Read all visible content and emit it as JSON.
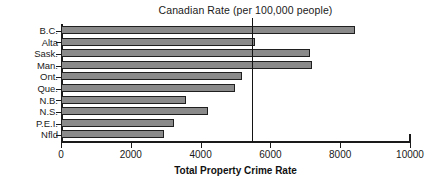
{
  "chart_data": {
    "type": "bar",
    "orientation": "horizontal",
    "title": "Canadian Rate (per 100,000 people)",
    "xlabel": "Total Property Crime Rate",
    "ylabel": "",
    "categories": [
      "B.C.",
      "Alta",
      "Sask.",
      "Man.",
      "Ont.",
      "Que.",
      "N.B.",
      "N.S.",
      "P.E.I.",
      "Nfld"
    ],
    "values": [
      8420,
      5570,
      7130,
      7200,
      5200,
      4980,
      3580,
      4200,
      3250,
      2950
    ],
    "xlim": [
      0,
      10000
    ],
    "xticks": [
      0,
      2000,
      4000,
      6000,
      8000,
      10000
    ],
    "xtick_labels": [
      "0",
      "2000",
      "4000",
      "6000",
      "8000",
      "10000"
    ],
    "grid": false,
    "legend": false,
    "annotations": [
      {
        "name": "canadian-rate-reference-line",
        "label": "Canadian Rate (per 100,000 people)",
        "value": 5460,
        "orientation": "vertical"
      }
    ],
    "colors": {
      "bar_fill": "#8a8a8a",
      "bar_border": "#1f1f1f",
      "axis": "#1a1a1a",
      "reference_line": "#141414",
      "background": "#ffffff"
    }
  }
}
